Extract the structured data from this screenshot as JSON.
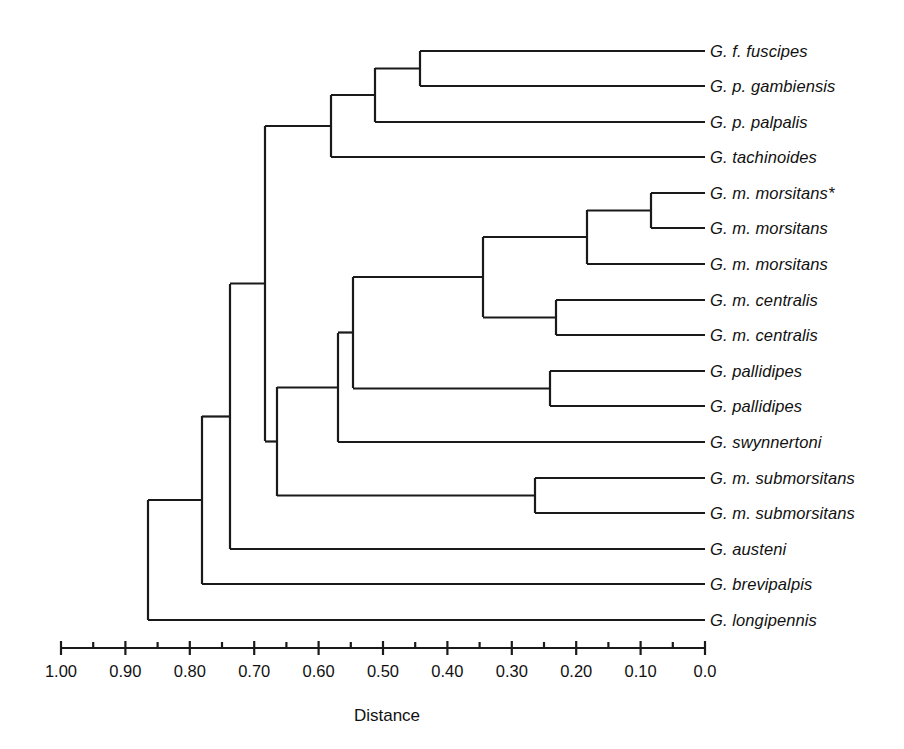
{
  "figure": {
    "type": "dendrogram",
    "line_color": "#1a1a1a",
    "background": "#ffffff"
  },
  "axis": {
    "title": "Distance",
    "title_x": 387,
    "title_y": 706,
    "line_y": 648,
    "left_px": 61,
    "right_px": 705,
    "min": 0.0,
    "max": 1.0,
    "direction": "decreasing-left-to-right",
    "major_step": 0.1,
    "minor_step": 0.05,
    "tick_labels": [
      "1.00",
      "0.90",
      "0.80",
      "0.70",
      "0.60",
      "0.50",
      "0.40",
      "0.30",
      "0.20",
      "0.10",
      "0.0"
    ],
    "tick_values": [
      1.0,
      0.9,
      0.8,
      0.7,
      0.6,
      0.5,
      0.4,
      0.3,
      0.2,
      0.1,
      0.0
    ],
    "minor_tick_values": [
      0.95,
      0.85,
      0.75,
      0.65,
      0.55,
      0.45,
      0.35,
      0.25,
      0.15,
      0.05
    ],
    "label_y": 662
  },
  "leaves": [
    {
      "label": "G. f. fuscipes",
      "y": 51
    },
    {
      "label": "G. p. gambiensis",
      "y": 86
    },
    {
      "label": "G. p. palpalis",
      "y": 122
    },
    {
      "label": "G. tachinoides",
      "y": 157
    },
    {
      "label": "G. m. morsitans*",
      "y": 193
    },
    {
      "label": "G. m. morsitans",
      "y": 228
    },
    {
      "label": "G. m. morsitans",
      "y": 264
    },
    {
      "label": "G. m. centralis",
      "y": 300
    },
    {
      "label": "G. m. centralis",
      "y": 335
    },
    {
      "label": "G. pallidipes",
      "y": 371
    },
    {
      "label": "G. pallidipes",
      "y": 406
    },
    {
      "label": "G. swynnertoni",
      "y": 442
    },
    {
      "label": "G. m. submorsitans",
      "y": 478
    },
    {
      "label": "G. m. submorsitans",
      "y": 513
    },
    {
      "label": "G. austeni",
      "y": 549
    },
    {
      "label": "G. brevipalpis",
      "y": 584
    },
    {
      "label": "G. longipennis",
      "y": 620
    }
  ],
  "label_x": 710,
  "nodes": [
    {
      "name": "fuscipes-gambiensis",
      "x": 420,
      "y_top": 51,
      "y_bot": 86,
      "distance": 0.44
    },
    {
      "name": "palpalis-subgroup",
      "x": 375,
      "y_top": 68,
      "y_bot": 122,
      "distance": 0.51
    },
    {
      "name": "palpalis-tachinoides",
      "x": 331,
      "y_top": 95,
      "y_bot": 157,
      "distance": 0.58
    },
    {
      "name": "palpalis-group-stem",
      "x": 265,
      "y_top": 126,
      "y_bot": 126,
      "distance": 0.68
    },
    {
      "name": "morsitans-pair",
      "x": 651,
      "y_top": 193,
      "y_bot": 228,
      "distance": 0.08
    },
    {
      "name": "morsitans-triple",
      "x": 587,
      "y_top": 210,
      "y_bot": 264,
      "distance": 0.18
    },
    {
      "name": "centralis-pair",
      "x": 556,
      "y_top": 300,
      "y_bot": 335,
      "distance": 0.23
    },
    {
      "name": "morsitans-centralis",
      "x": 483,
      "y_top": 237,
      "y_bot": 318,
      "distance": 0.345
    },
    {
      "name": "pallidipes-pair",
      "x": 550,
      "y_top": 371,
      "y_bot": 406,
      "distance": 0.24
    },
    {
      "name": "morsitans-pallidipes",
      "x": 353,
      "y_top": 277,
      "y_bot": 388,
      "distance": 0.546
    },
    {
      "name": "plus-swynnertoni",
      "x": 338,
      "y_top": 333,
      "y_bot": 442,
      "distance": 0.57
    },
    {
      "name": "submorsitans-pair",
      "x": 535,
      "y_top": 478,
      "y_bot": 513,
      "distance": 0.264
    },
    {
      "name": "morsitans-group-root",
      "x": 277,
      "y_top": 387,
      "y_bot": 496,
      "distance": 0.665
    },
    {
      "name": "palpalis-morsitans-root",
      "x": 265,
      "y_top": 126,
      "y_bot": 441,
      "distance": 0.683
    },
    {
      "name": "plus-austeni",
      "x": 230,
      "y_top": 284,
      "y_bot": 549,
      "distance": 0.738
    },
    {
      "name": "plus-brevipalpis",
      "x": 202,
      "y_top": 416,
      "y_bot": 584,
      "distance": 0.781
    },
    {
      "name": "root",
      "x": 148,
      "y_top": 500,
      "y_bot": 620,
      "distance": 0.865
    }
  ],
  "chart_data": {
    "type": "dendrogram",
    "title": "",
    "xlabel": "Distance",
    "ylabel": "",
    "xlim": [
      1.0,
      0.0
    ],
    "grid": false,
    "legend": "none",
    "xtick_labels": [
      "1.00",
      "0.90",
      "0.80",
      "0.70",
      "0.60",
      "0.50",
      "0.40",
      "0.30",
      "0.20",
      "0.10",
      "0.0"
    ],
    "xticks": [
      1.0,
      0.9,
      0.8,
      0.7,
      0.6,
      0.5,
      0.4,
      0.3,
      0.2,
      0.1,
      0.0
    ],
    "leaf_labels": [
      "G. f. fuscipes",
      "G. p. gambiensis",
      "G. p. palpalis",
      "G. tachinoides",
      "G. m. morsitans*",
      "G. m. morsitans",
      "G. m. morsitans",
      "G. m. centralis",
      "G. m. centralis",
      "G. pallidipes",
      "G. pallidipes",
      "G. swynnertoni",
      "G. m. submorsitans",
      "G. m. submorsitans",
      "G. austeni",
      "G. brevipalpis",
      "G. longipennis"
    ],
    "merges": [
      {
        "members": [
          "G. f. fuscipes",
          "G. p. gambiensis"
        ],
        "distance": 0.44
      },
      {
        "members": [
          "(fuscipes,gambiensis)",
          "G. p. palpalis"
        ],
        "distance": 0.51
      },
      {
        "members": [
          "(fuscipes,gambiensis,palpalis)",
          "G. tachinoides"
        ],
        "distance": 0.58
      },
      {
        "members": [
          "G. m. morsitans*",
          "G. m. morsitans"
        ],
        "distance": 0.08
      },
      {
        "members": [
          "(morsitans*,morsitans)",
          "G. m. morsitans"
        ],
        "distance": 0.18
      },
      {
        "members": [
          "G. m. centralis",
          "G. m. centralis"
        ],
        "distance": 0.23
      },
      {
        "members": [
          "(morsitans x3)",
          "(centralis x2)"
        ],
        "distance": 0.345
      },
      {
        "members": [
          "G. pallidipes",
          "G. pallidipes"
        ],
        "distance": 0.24
      },
      {
        "members": [
          "(morsitans,centralis)",
          "(pallidipes x2)"
        ],
        "distance": 0.546
      },
      {
        "members": [
          "(morsitans,centralis,pallidipes)",
          "G. swynnertoni"
        ],
        "distance": 0.57
      },
      {
        "members": [
          "G. m. submorsitans",
          "G. m. submorsitans"
        ],
        "distance": 0.264
      },
      {
        "members": [
          "(morsitans clade)",
          "(submorsitans x2)"
        ],
        "distance": 0.665
      },
      {
        "members": [
          "(palpalis group)",
          "(morsitans group)"
        ],
        "distance": 0.683
      },
      {
        "members": [
          "(palpalis+morsitans)",
          "G. austeni"
        ],
        "distance": 0.738
      },
      {
        "members": [
          "(previous)",
          "G. brevipalpis"
        ],
        "distance": 0.781
      },
      {
        "members": [
          "(previous)",
          "G. longipennis"
        ],
        "distance": 0.865
      }
    ]
  }
}
